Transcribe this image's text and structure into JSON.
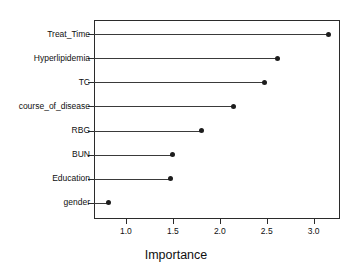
{
  "chart_data": {
    "type": "scatter",
    "subtype": "dot-plot",
    "title": "",
    "xlabel": "Importance",
    "ylabel": "",
    "categories": [
      "Treat_Time",
      "Hyperlipidemia",
      "TC",
      "course_of_disease",
      "RBG",
      "BUN",
      "Education",
      "gender"
    ],
    "values": [
      3.16,
      2.61,
      2.48,
      2.15,
      1.8,
      1.5,
      1.47,
      0.81
    ],
    "points": [
      {
        "label": "Treat_Time",
        "value": 3.16
      },
      {
        "label": "Hyperlipidemia",
        "value": 2.61
      },
      {
        "label": "TC",
        "value": 2.48
      },
      {
        "label": "course_of_disease",
        "value": 2.15
      },
      {
        "label": "RBG",
        "value": 1.8
      },
      {
        "label": "BUN",
        "value": 1.5
      },
      {
        "label": "Education",
        "value": 1.47
      },
      {
        "label": "gender",
        "value": 0.81
      }
    ],
    "xticks": [
      1.0,
      1.5,
      2.0,
      2.5,
      3.0
    ],
    "xticklabels": [
      "1.0",
      "1.5",
      "2.0",
      "2.5",
      "3.0"
    ],
    "xlim": [
      0.66,
      3.28
    ],
    "grid": false,
    "legend": false,
    "marker": "filled-circle",
    "colors": {
      "marker": "#1d1d1d",
      "line": "#3a3a3a",
      "frame": "#2b2b2b",
      "background": "#ffffff",
      "text": "#101010"
    }
  }
}
